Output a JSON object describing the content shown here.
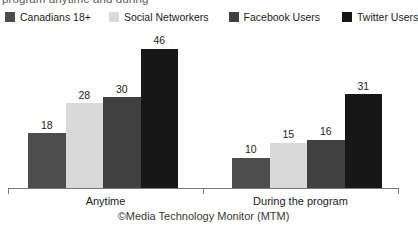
{
  "caption": {
    "clipped_top_text": "program anytime and during"
  },
  "legend": {
    "items": [
      {
        "label": "Canadians 18+",
        "color": "#4d4d4d"
      },
      {
        "label": "Social Networkers",
        "color": "#d9d9d9"
      },
      {
        "label": "Facebook Users",
        "color": "#404040"
      },
      {
        "label": "Twitter Users",
        "color": "#171717"
      }
    ]
  },
  "credit": {
    "text": "©Media Technology Monitor (MTM)"
  },
  "chart_data": {
    "type": "bar",
    "title": "",
    "subtitle": "",
    "xlabel": "",
    "ylabel": "",
    "ylim": [
      0,
      50
    ],
    "grid": false,
    "legend_position": "top",
    "categories": [
      "Anytime",
      "During the program"
    ],
    "series": [
      {
        "name": "Canadians 18+",
        "color": "#4d4d4d",
        "values": [
          18,
          10
        ]
      },
      {
        "name": "Social Networkers",
        "color": "#d9d9d9",
        "values": [
          28,
          15
        ]
      },
      {
        "name": "Facebook Users",
        "color": "#404040",
        "values": [
          30,
          16
        ]
      },
      {
        "name": "Twitter Users",
        "color": "#171717",
        "values": [
          46,
          31
        ]
      }
    ],
    "annotations": [
      "©Media Technology Monitor (MTM)"
    ]
  }
}
